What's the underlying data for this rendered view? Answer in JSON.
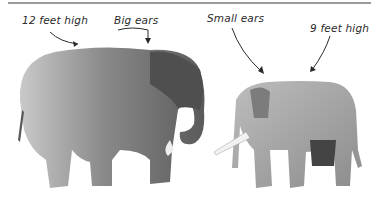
{
  "figure": {
    "annotations": [
      {
        "id": "african-height",
        "text": "12 feet high"
      },
      {
        "id": "african-ears",
        "text": "Big ears"
      },
      {
        "id": "asian-ears",
        "text": "Small ears"
      },
      {
        "id": "asian-height",
        "text": "9 feet high"
      }
    ],
    "subjects": [
      {
        "name": "african-elephant",
        "features": [
          "12 feet high",
          "Big ears"
        ]
      },
      {
        "name": "asian-elephant",
        "features": [
          "Small ears",
          "9 feet high"
        ]
      }
    ]
  }
}
